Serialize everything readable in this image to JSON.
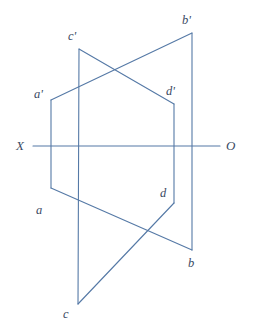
{
  "figure": {
    "width": 256,
    "height": 333,
    "background_color": "#ffffff",
    "stroke_color": "#5579a6",
    "label_color": "#3a4a63",
    "stroke_width": 1.1
  },
  "axis": {
    "name": "ground-line-XO",
    "left_label": "X",
    "right_label": "O",
    "y": 146,
    "x_start": 33,
    "x_end": 220,
    "left_label_pos": {
      "x": 16,
      "y": 139
    },
    "right_label_pos": {
      "x": 226,
      "y": 139
    }
  },
  "points": [
    {
      "id": "a-prime",
      "label": "a'",
      "x": 51,
      "y": 100,
      "label_x": 34,
      "label_y": 88
    },
    {
      "id": "c-prime",
      "label": "c'",
      "x": 79,
      "y": 49,
      "label_x": 68,
      "label_y": 30
    },
    {
      "id": "b-prime",
      "label": "b'",
      "x": 192,
      "y": 33,
      "label_x": 182,
      "label_y": 14
    },
    {
      "id": "d-prime",
      "label": "d'",
      "x": 174,
      "y": 104,
      "label_x": 166,
      "label_y": 85
    },
    {
      "id": "a",
      "label": "a",
      "x": 51,
      "y": 188,
      "label_x": 36,
      "label_y": 204
    },
    {
      "id": "d",
      "label": "d",
      "x": 174,
      "y": 203,
      "label_x": 160,
      "label_y": 187
    },
    {
      "id": "b",
      "label": "b",
      "x": 192,
      "y": 250,
      "label_x": 188,
      "label_y": 257
    },
    {
      "id": "c",
      "label": "c",
      "x": 78,
      "y": 304,
      "label_x": 63,
      "label_y": 308
    }
  ],
  "segments": [
    {
      "id": "frontal-ab",
      "from": "a-prime",
      "to": "b-prime",
      "x1": 51,
      "y1": 100,
      "x2": 192,
      "y2": 33
    },
    {
      "id": "frontal-cd",
      "from": "c-prime",
      "to": "d-prime",
      "x1": 79,
      "y1": 49,
      "x2": 174,
      "y2": 104
    },
    {
      "id": "horizontal-ab",
      "from": "a",
      "to": "b",
      "x1": 51,
      "y1": 188,
      "x2": 192,
      "y2": 250
    },
    {
      "id": "horizontal-cd",
      "from": "c",
      "to": "d",
      "x1": 78,
      "y1": 304,
      "x2": 174,
      "y2": 203
    },
    {
      "id": "projector-a",
      "from": "a-prime",
      "to": "a",
      "x1": 51,
      "y1": 100,
      "x2": 51,
      "y2": 188
    },
    {
      "id": "projector-c",
      "from": "c-prime",
      "to": "c",
      "x1": 79,
      "y1": 49,
      "x2": 78,
      "y2": 304
    },
    {
      "id": "projector-d",
      "from": "d-prime",
      "to": "d",
      "x1": 174,
      "y1": 104,
      "x2": 174,
      "y2": 203
    },
    {
      "id": "projector-b",
      "from": "b-prime",
      "to": "b",
      "x1": 192,
      "y1": 33,
      "x2": 192,
      "y2": 250
    }
  ]
}
